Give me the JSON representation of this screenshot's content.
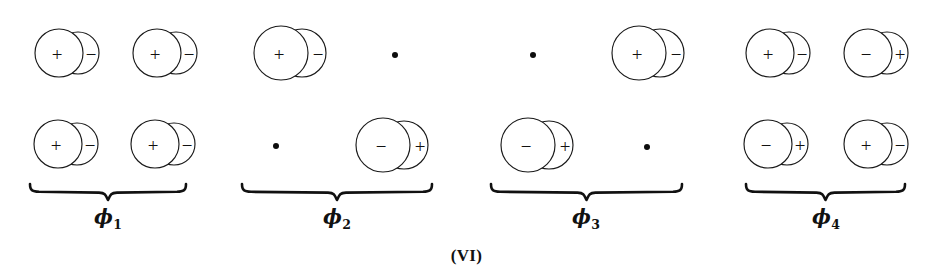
{
  "figure": {
    "caption": "(VI)",
    "width": 933,
    "height": 280,
    "background": "#ffffff",
    "ink_color": "#111111"
  },
  "chart_data": {
    "type": "diagram",
    "title": "(VI)",
    "subtitle": "",
    "symbol_legend": [
      {
        "symbol": "orbital-pair",
        "meaning": "two overlapping circles with + and - lobe signs"
      },
      {
        "symbol": "node-dot",
        "meaning": "filled dot = zero coefficient at that atomic position"
      }
    ],
    "groups": [
      {
        "label": "ϕ",
        "subscript": "1",
        "brace": {
          "x_start": 28,
          "x_end": 188,
          "y": 182
        },
        "label_x": 108,
        "label_y": 205,
        "cells": [
          {
            "row": 0,
            "col": 0,
            "kind": "orbital",
            "left_sign": "+",
            "right_sign": "−",
            "cx": 59,
            "cy": 53,
            "r": 24,
            "r2": 21,
            "offset": 19
          },
          {
            "row": 0,
            "col": 1,
            "kind": "orbital",
            "left_sign": "+",
            "right_sign": "−",
            "cx": 157,
            "cy": 53,
            "r": 24,
            "r2": 21,
            "offset": 19
          },
          {
            "row": 1,
            "col": 0,
            "kind": "orbital",
            "left_sign": "+",
            "right_sign": "−",
            "cx": 58,
            "cy": 144,
            "r": 24,
            "r2": 21,
            "offset": 19
          },
          {
            "row": 1,
            "col": 1,
            "kind": "orbital",
            "left_sign": "+",
            "right_sign": "−",
            "cx": 155,
            "cy": 144,
            "r": 24,
            "r2": 21,
            "offset": 19
          }
        ]
      },
      {
        "label": "ϕ",
        "subscript": "2",
        "brace": {
          "x_start": 240,
          "x_end": 434,
          "y": 182
        },
        "label_x": 337,
        "label_y": 205,
        "cells": [
          {
            "row": 0,
            "col": 0,
            "kind": "orbital",
            "left_sign": "+",
            "right_sign": "−",
            "cx": 281,
            "cy": 53,
            "r": 27,
            "r2": 24,
            "offset": 21
          },
          {
            "row": 0,
            "col": 1,
            "kind": "node",
            "cx": 395,
            "cy": 55
          },
          {
            "row": 1,
            "col": 0,
            "kind": "node",
            "cx": 276,
            "cy": 146
          },
          {
            "row": 1,
            "col": 1,
            "kind": "orbital",
            "left_sign": "−",
            "right_sign": "+",
            "cx": 383,
            "cy": 145,
            "r": 27,
            "r2": 24,
            "offset": 21
          }
        ]
      },
      {
        "label": "ϕ",
        "subscript": "3",
        "brace": {
          "x_start": 489,
          "x_end": 684,
          "y": 182
        },
        "label_x": 586,
        "label_y": 205,
        "cells": [
          {
            "row": 0,
            "col": 0,
            "kind": "node",
            "cx": 533,
            "cy": 55
          },
          {
            "row": 0,
            "col": 1,
            "kind": "orbital",
            "left_sign": "+",
            "right_sign": "−",
            "cx": 639,
            "cy": 53,
            "r": 27,
            "r2": 24,
            "offset": 21
          },
          {
            "row": 1,
            "col": 0,
            "kind": "orbital",
            "left_sign": "−",
            "right_sign": "+",
            "cx": 528,
            "cy": 145,
            "r": 27,
            "r2": 24,
            "offset": 21
          },
          {
            "row": 1,
            "col": 1,
            "kind": "node",
            "cx": 647,
            "cy": 147
          }
        ]
      },
      {
        "label": "ϕ",
        "subscript": "4",
        "brace": {
          "x_start": 744,
          "x_end": 907,
          "y": 182
        },
        "label_x": 826,
        "label_y": 205,
        "cells": [
          {
            "row": 0,
            "col": 0,
            "kind": "orbital",
            "left_sign": "+",
            "right_sign": "−",
            "cx": 770,
            "cy": 53,
            "r": 24,
            "r2": 21,
            "offset": 19
          },
          {
            "row": 0,
            "col": 1,
            "kind": "orbital",
            "left_sign": "−",
            "right_sign": "+",
            "cx": 868,
            "cy": 53,
            "r": 24,
            "r2": 21,
            "offset": 19
          },
          {
            "row": 1,
            "col": 0,
            "kind": "orbital",
            "left_sign": "−",
            "right_sign": "+",
            "cx": 768,
            "cy": 144,
            "r": 24,
            "r2": 21,
            "offset": 19
          },
          {
            "row": 1,
            "col": 1,
            "kind": "orbital",
            "left_sign": "+",
            "right_sign": "−",
            "cx": 868,
            "cy": 144,
            "r": 24,
            "r2": 21,
            "offset": 19
          }
        ]
      }
    ]
  }
}
